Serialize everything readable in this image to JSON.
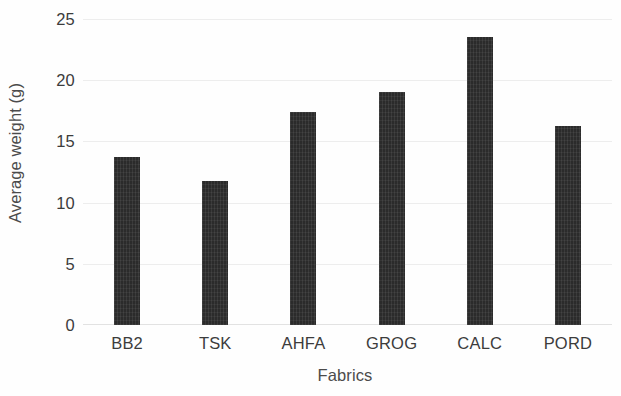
{
  "chart_data": {
    "type": "bar",
    "title": "",
    "xlabel": "Fabrics",
    "ylabel": "Average weight (g)",
    "categories": [
      "BB2",
      "TSK",
      "AHFA",
      "GROG",
      "CALC",
      "PORD"
    ],
    "values": [
      13.7,
      11.8,
      17.4,
      19.0,
      23.5,
      16.3
    ],
    "ylim": [
      0,
      25
    ],
    "yticks": [
      0,
      5,
      10,
      15,
      20,
      25
    ],
    "ytick_labels": [
      "0",
      "5",
      "10",
      "15",
      "20",
      "25"
    ],
    "grid": true,
    "grid_axis": "y",
    "legend": false,
    "legend_position": "none",
    "bar_color": "#2b2b2b",
    "grid_color": "#ededed",
    "text_color": "#3c3c3c"
  }
}
